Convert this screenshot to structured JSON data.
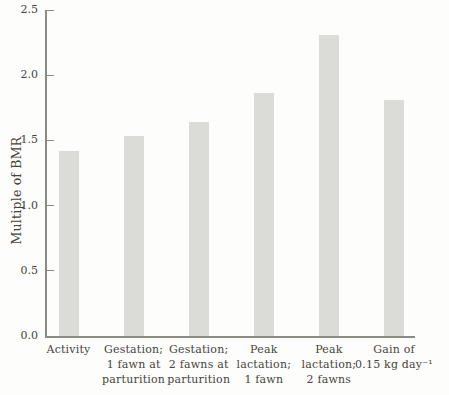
{
  "chart_data": {
    "type": "bar",
    "title": "",
    "xlabel": "",
    "ylabel": "Multiple of BMR",
    "ylim": [
      0,
      2.5
    ],
    "yticks": [
      0.0,
      0.5,
      1.0,
      1.5,
      2.0,
      2.5
    ],
    "ytick_labels": [
      "0.0",
      "0.5",
      "1.0",
      "1.5",
      "2.0",
      "2.5"
    ],
    "grid": false,
    "legend": "none",
    "categories": [
      "Activity",
      "Gestation; 1 fawn at parturition",
      "Gestation; 2 fawns at parturition",
      "Peak lactation; 1 fawn",
      "Peak lactation; 2 fawns",
      "Gain of 0.15 kg day⁻¹"
    ],
    "category_lines": [
      [
        "Activity"
      ],
      [
        "Gestation;",
        "1 fawn at",
        "parturition"
      ],
      [
        "Gestation;",
        "2 fawns at",
        "parturition"
      ],
      [
        "Peak",
        "lactation;",
        "1 fawn"
      ],
      [
        "Peak",
        "lactation;",
        "2 fawns"
      ],
      [
        "Gain of",
        "0.15 kg day⁻¹"
      ]
    ],
    "values": [
      1.42,
      1.53,
      1.64,
      1.86,
      2.31,
      1.81
    ],
    "colors": {
      "background": "#fdfdfb",
      "bar_fill": "#dbdbd7",
      "axis": "#8b8b86",
      "text": "#46443d"
    }
  }
}
